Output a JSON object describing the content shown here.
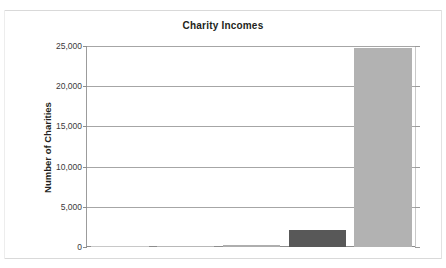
{
  "chart_data": {
    "type": "bar",
    "title": "Charity Incomes",
    "xlabel": "",
    "ylabel": "Number of Charities",
    "categories": [
      "1",
      "2",
      "3",
      "4",
      "5"
    ],
    "values": [
      60,
      120,
      200,
      2100,
      24700
    ],
    "ylim": [
      0,
      25000
    ],
    "yticks": [
      0,
      5000,
      10000,
      15000,
      20000,
      25000
    ],
    "ytick_labels": [
      "0",
      "5,000",
      "10,000",
      "15,000",
      "20,000",
      "25,000"
    ],
    "grid": true,
    "legend": "none",
    "series": [
      {
        "name": "Number of Charities",
        "values": [
          60,
          120,
          200,
          2100,
          24700
        ],
        "colors": [
          "#c8c8c8",
          "#b8b8b8",
          "#aeaeae",
          "#585858",
          "#b2b2b2"
        ]
      }
    ],
    "colors": {
      "light_bar": "#b2b2b2",
      "dark_bar": "#585858",
      "gridline": "#a6a6a6",
      "axis": "#8d8d8d",
      "text": "#231f20",
      "background": "#ffffff"
    }
  }
}
